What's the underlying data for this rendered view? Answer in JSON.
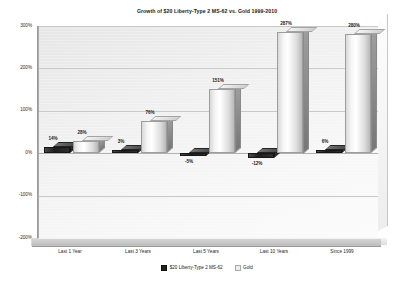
{
  "chart_data": {
    "type": "bar",
    "title": "Growth of $20 Liberty-Type 2 MS-62  vs.  Gold 1999-2010",
    "xlabel": "",
    "ylabel": "",
    "ylim": [
      -200,
      300
    ],
    "yticks": [
      "300%",
      "200%",
      "100%",
      "0%",
      "-100%",
      "-200%"
    ],
    "ytick_values": [
      300,
      200,
      100,
      0,
      -100,
      -200
    ],
    "grid": true,
    "legend_position": "bottom",
    "categories": [
      "Last 1 Year",
      "Last 3 Years",
      "Last 5 Years",
      "Last 10 Years",
      "Since 1999"
    ],
    "series": [
      {
        "name": "$20 Liberty-Type 2 MS-62",
        "color": "#232323",
        "values": [
          14,
          3,
          -5,
          -12,
          6
        ],
        "labels": [
          "14%",
          "3%",
          "-5%",
          "-12%",
          "6%"
        ]
      },
      {
        "name": "Gold",
        "color": "#ededed",
        "values": [
          28,
          76,
          151,
          287,
          280
        ],
        "labels": [
          "28%",
          "76%",
          "151%",
          "287%",
          "280%"
        ]
      }
    ]
  }
}
